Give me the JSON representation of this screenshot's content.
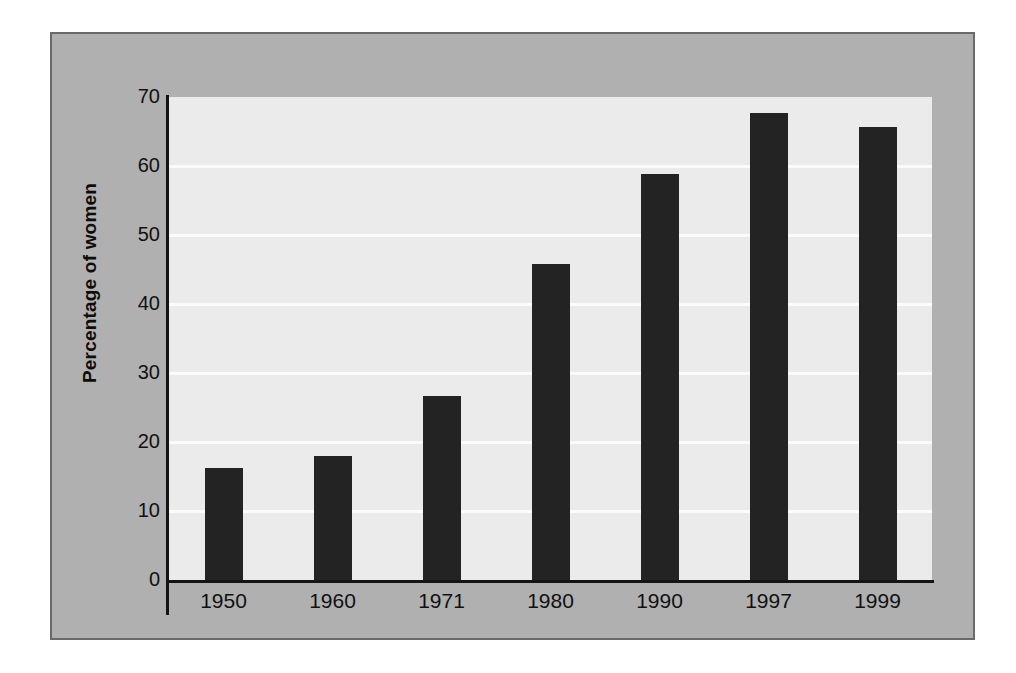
{
  "figure": {
    "background_color": "#b0b0b0",
    "border_color": "#6a6a6a",
    "plot_background_color": "#ebebeb",
    "gridline_color": "#fbfbfb",
    "bar_color": "#232323",
    "axis_color": "#141414"
  },
  "chart_data": {
    "type": "bar",
    "title": "",
    "xlabel": "",
    "ylabel": "Percentage of women",
    "categories": [
      "1950",
      "1960",
      "1971",
      "1980",
      "1990",
      "1997",
      "1999"
    ],
    "values": [
      16.3,
      18.0,
      26.7,
      45.8,
      58.8,
      67.7,
      65.6
    ],
    "series": [
      {
        "name": "Percentage of women",
        "values": [
          16.3,
          18.0,
          26.7,
          45.8,
          58.8,
          67.7,
          65.6
        ]
      }
    ],
    "ylim": [
      0,
      70
    ],
    "yticks": [
      0,
      10,
      20,
      30,
      40,
      50,
      60,
      70
    ],
    "ytick_labels": [
      "0",
      "10",
      "20",
      "30",
      "40",
      "50",
      "60",
      "70"
    ],
    "grid": true,
    "grid_axis": "y",
    "legend": false,
    "legend_position": "none"
  }
}
